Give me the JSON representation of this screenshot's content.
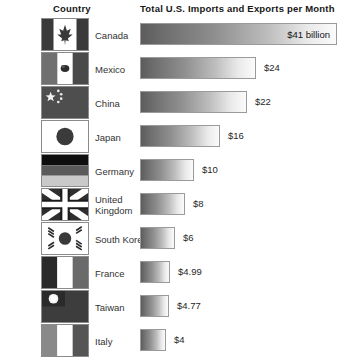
{
  "headers": {
    "country": "Country",
    "value": "Total U.S. Imports and Exports per Month"
  },
  "chart_data": {
    "type": "bar",
    "title": "Total U.S. Imports and Exports per Month",
    "xlabel": "",
    "ylabel": "Country",
    "orientation": "horizontal",
    "grid": false,
    "legend": false,
    "units": "billions of U.S. dollars per month",
    "categories": [
      "Canada",
      "Mexico",
      "China",
      "Japan",
      "Germany",
      "United Kingdom",
      "South Korea",
      "France",
      "Taiwan",
      "Italy"
    ],
    "values": [
      41,
      24,
      22,
      16,
      10,
      8,
      6,
      4.99,
      4.77,
      4
    ],
    "value_labels": [
      "$41 billion",
      "$24",
      "$22",
      "$16",
      "$10",
      "$8",
      "$6",
      "$4.99",
      "$4.77",
      "$4"
    ],
    "xlim": [
      0,
      41
    ]
  },
  "rows": [
    {
      "country": "Canada",
      "flag": "flag-canada",
      "label": "$41 billion",
      "label_inside": true,
      "bar_w": 197
    },
    {
      "country": "Mexico",
      "flag": "flag-mexico",
      "label": "$24",
      "label_inside": false,
      "bar_w": 116
    },
    {
      "country": "China",
      "flag": "flag-china",
      "label": "$22",
      "label_inside": false,
      "bar_w": 107
    },
    {
      "country": "Japan",
      "flag": "flag-japan",
      "label": "$16",
      "label_inside": false,
      "bar_w": 80
    },
    {
      "country": "Germany",
      "flag": "flag-germany",
      "label": "$10",
      "label_inside": false,
      "bar_w": 54
    },
    {
      "country": "United Kingdom",
      "flag": "flag-united-kingdom",
      "label": "$8",
      "label_inside": false,
      "bar_w": 45
    },
    {
      "country": "South Korea",
      "flag": "flag-south-korea",
      "label": "$6",
      "label_inside": false,
      "bar_w": 35
    },
    {
      "country": "France",
      "flag": "flag-france",
      "label": "$4.99",
      "label_inside": false,
      "bar_w": 30
    },
    {
      "country": "Taiwan",
      "flag": "flag-taiwan",
      "label": "$4.77",
      "label_inside": false,
      "bar_w": 29
    },
    {
      "country": "Italy",
      "flag": "flag-italy",
      "label": "$4",
      "label_inside": false,
      "bar_w": 26
    }
  ]
}
